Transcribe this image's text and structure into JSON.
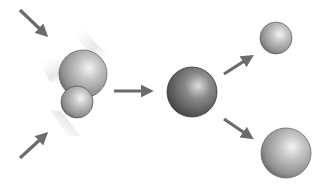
{
  "diagram": {
    "type": "particle-collision-and-decay",
    "stages": [
      {
        "name": "incoming-particles",
        "count": 2
      },
      {
        "name": "compound-particle",
        "count": 1
      },
      {
        "name": "outgoing-particles",
        "count": 2
      }
    ],
    "colors": {
      "arrow": "#6b6b6b",
      "sphere_light": "#f2f2f2",
      "sphere_mid": "#a8a8a8",
      "sphere_dark": "#5a5a5a",
      "compound_dark": "#3c3c3c",
      "motion_blur": "#e6e6e6"
    },
    "spheres": [
      {
        "id": "incoming-large",
        "cx": 83,
        "cy": 74,
        "r": 24
      },
      {
        "id": "incoming-small",
        "cx": 77,
        "cy": 102,
        "r": 16
      },
      {
        "id": "compound",
        "cx": 192,
        "cy": 92,
        "r": 25
      },
      {
        "id": "outgoing-small",
        "cx": 276,
        "cy": 38,
        "r": 16
      },
      {
        "id": "outgoing-large",
        "cx": 286,
        "cy": 153,
        "r": 25
      }
    ],
    "arrows": [
      {
        "id": "incoming-top",
        "x1": 20,
        "y1": 10,
        "x2": 46,
        "y2": 35
      },
      {
        "id": "incoming-bottom",
        "x1": 20,
        "y1": 158,
        "x2": 46,
        "y2": 134
      },
      {
        "id": "to-compound",
        "x1": 114,
        "y1": 91,
        "x2": 152,
        "y2": 91
      },
      {
        "id": "decay-up",
        "x1": 224,
        "y1": 74,
        "x2": 252,
        "y2": 56
      },
      {
        "id": "decay-down",
        "x1": 224,
        "y1": 119,
        "x2": 252,
        "y2": 138
      }
    ]
  }
}
